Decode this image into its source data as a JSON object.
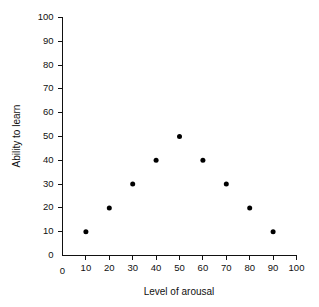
{
  "chart_data": {
    "type": "scatter",
    "title": "",
    "xlabel": "Level of arousal",
    "ylabel": "Ability to learn",
    "xlim": [
      0,
      100
    ],
    "ylim": [
      0,
      100
    ],
    "xticks": [
      0,
      10,
      20,
      30,
      40,
      50,
      60,
      70,
      80,
      90,
      100
    ],
    "yticks": [
      0,
      10,
      20,
      30,
      40,
      50,
      60,
      70,
      80,
      90,
      100
    ],
    "xtick_labels": [
      "0",
      "10",
      "20",
      "30",
      "40",
      "50",
      "60",
      "70",
      "80",
      "90",
      "100"
    ],
    "ytick_labels": [
      "0",
      "10",
      "20",
      "30",
      "40",
      "50",
      "60",
      "70",
      "80",
      "90",
      "100"
    ],
    "grid": false,
    "legend": null,
    "marker": "filled-circle",
    "marker_color": "#000000",
    "marker_size": 5,
    "x": [
      10,
      20,
      30,
      40,
      50,
      60,
      70,
      80,
      90
    ],
    "y": [
      10,
      20,
      30,
      40,
      50,
      40,
      30,
      20,
      10
    ],
    "points": [
      {
        "x": 10,
        "y": 10
      },
      {
        "x": 20,
        "y": 20
      },
      {
        "x": 30,
        "y": 30
      },
      {
        "x": 40,
        "y": 40
      },
      {
        "x": 50,
        "y": 50
      },
      {
        "x": 60,
        "y": 40
      },
      {
        "x": 70,
        "y": 30
      },
      {
        "x": 80,
        "y": 20
      },
      {
        "x": 90,
        "y": 10
      }
    ],
    "annotations": []
  },
  "figure": {
    "background_color": "#ffffff",
    "axis_color": "#111111"
  }
}
